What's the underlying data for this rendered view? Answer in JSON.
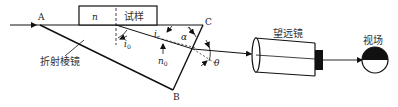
{
  "diagram": {
    "points": {
      "A": "A",
      "B": "B",
      "C": "C"
    },
    "labels": {
      "sample_index": "n",
      "sample": "试样",
      "prism": "折射棱镜",
      "telescope": "望远镜",
      "field_of_view": "视场",
      "incidence_angle": "i",
      "incidence_sub": "0",
      "refraction_angle": "i",
      "refraction_sub": "r",
      "prism_index": "n",
      "prism_index_sub": "0",
      "prism_angle": "α",
      "exit_angle": "θ"
    },
    "colors": {
      "line": "#111111",
      "background": "#ffffff",
      "field_dark": "#111111",
      "field_light": "#ffffff"
    }
  }
}
